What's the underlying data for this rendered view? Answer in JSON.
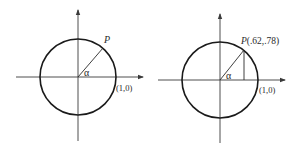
{
  "figure": {
    "left": {
      "point_label": "P",
      "angle_label": "α",
      "axis_point_label": "(1,0)"
    },
    "right": {
      "point_label": "P",
      "point_coords": "(.62,.78)",
      "angle_label": "α",
      "axis_point_label": "(1,0)"
    },
    "colors": {
      "stroke": "#1a1a1a",
      "axis": "#3a3a3a",
      "text": "#2a2a2a",
      "background": "#ffffff"
    }
  }
}
